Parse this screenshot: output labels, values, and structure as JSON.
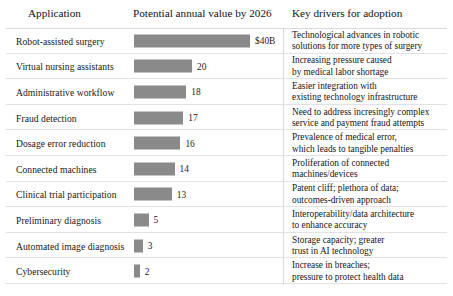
{
  "header": {
    "application": "Application",
    "value": "Potential annual value by 2026",
    "drivers": "Key drivers for adoption"
  },
  "colors": {
    "bar_fill": "#8a8a8a",
    "divider": "#e2e2e2",
    "separator": "#dadada",
    "text": "#181818",
    "background": "#ffffff"
  },
  "chart_data": {
    "type": "bar",
    "title": "Potential annual value by 2026",
    "xlabel": "",
    "ylabel": "Application",
    "unit": "$B",
    "orientation": "horizontal",
    "grid": false,
    "legend": false,
    "xlim": [
      0,
      40
    ],
    "categories": [
      "Robot-assisted surgery",
      "Virtual nursing assistants",
      "Administrative workflow",
      "Fraud detection",
      "Dosage error reduction",
      "Connected machines",
      "Clinical trial participation",
      "Preliminary diagnosis",
      "Automated image diagnosis",
      "Cybersecurity"
    ],
    "values": [
      40,
      20,
      18,
      17,
      16,
      14,
      13,
      5,
      3,
      2
    ],
    "value_labels": [
      "$40B",
      "20",
      "18",
      "17",
      "16",
      "14",
      "13",
      "5",
      "3",
      "2"
    ]
  },
  "rows": [
    {
      "application": "Robot-assisted surgery",
      "value": 40,
      "value_label": "$40B",
      "driver_lines": [
        "Technological advances in robotic",
        "solutions for more types of surgery"
      ]
    },
    {
      "application": "Virtual nursing assistants",
      "value": 20,
      "value_label": "20",
      "driver_lines": [
        "Increasing pressure caused",
        "by medical labor shortage"
      ]
    },
    {
      "application": "Administrative workflow",
      "value": 18,
      "value_label": "18",
      "driver_lines": [
        "Easier integration with",
        "existing technology infrastructure"
      ]
    },
    {
      "application": "Fraud detection",
      "value": 17,
      "value_label": "17",
      "driver_lines": [
        "Need to address incresingly complex",
        "service and payment fraud attempts"
      ]
    },
    {
      "application": "Dosage error reduction",
      "value": 16,
      "value_label": "16",
      "driver_lines": [
        "Prevalence of medical error,",
        "which leads to tangible penalties"
      ]
    },
    {
      "application": "Connected machines",
      "value": 14,
      "value_label": "14",
      "driver_lines": [
        "Proliferation of connected",
        "machines/devices"
      ]
    },
    {
      "application": "Clinical trial participation",
      "value": 13,
      "value_label": "13",
      "driver_lines": [
        "Patent cliff; plethora of data;",
        "outcomes-driven approach"
      ]
    },
    {
      "application": "Preliminary diagnosis",
      "value": 5,
      "value_label": "5",
      "driver_lines": [
        "Interoperability/data architecture",
        "to enhance accuracy"
      ]
    },
    {
      "application": "Automated image diagnosis",
      "value": 3,
      "value_label": "3",
      "driver_lines": [
        "Storage capacity; greater",
        "trust in AI technology"
      ]
    },
    {
      "application": "Cybersecurity",
      "value": 2,
      "value_label": "2",
      "driver_lines": [
        "Increase in breaches;",
        "pressure to protect health data"
      ]
    }
  ]
}
